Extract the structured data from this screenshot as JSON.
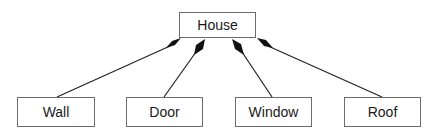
{
  "diagram": {
    "type": "uml-composition",
    "parent": {
      "label": "House",
      "x": 179,
      "y": 12,
      "w": 77,
      "h": 26
    },
    "children": [
      {
        "label": "Wall",
        "x": 17,
        "y": 97,
        "w": 78,
        "h": 30
      },
      {
        "label": "Door",
        "x": 126,
        "y": 97,
        "w": 77,
        "h": 30
      },
      {
        "label": "Window",
        "x": 235,
        "y": 97,
        "w": 77,
        "h": 30
      },
      {
        "label": "Roof",
        "x": 344,
        "y": 97,
        "w": 77,
        "h": 30
      }
    ],
    "edges": [
      {
        "from": "Wall",
        "to": "House",
        "end": "filled-diamond"
      },
      {
        "from": "Door",
        "to": "House",
        "end": "filled-diamond"
      },
      {
        "from": "Window",
        "to": "House",
        "end": "filled-diamond"
      },
      {
        "from": "Roof",
        "to": "House",
        "end": "filled-diamond"
      }
    ],
    "colors": {
      "line": "#222222",
      "diamond": "#111111",
      "box_border": "#6b6b6b",
      "background": "#ffffff"
    }
  }
}
